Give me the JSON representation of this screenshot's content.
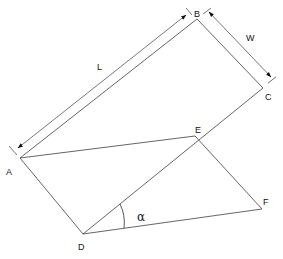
{
  "diagram": {
    "type": "geometry",
    "points": {
      "A": {
        "label": "A",
        "x": 20,
        "y": 158
      },
      "B": {
        "label": "B",
        "x": 197,
        "y": 19
      },
      "C": {
        "label": "C",
        "x": 263,
        "y": 88
      },
      "D": {
        "label": "D",
        "x": 83,
        "y": 234
      },
      "E": {
        "label": "E",
        "x": 199,
        "y": 139
      },
      "F": {
        "label": "F",
        "x": 262,
        "y": 209
      }
    },
    "edges": [
      [
        "A",
        "B"
      ],
      [
        "B",
        "C"
      ],
      [
        "C",
        "D"
      ],
      [
        "A",
        "D"
      ],
      [
        "A",
        "E"
      ],
      [
        "E",
        "F"
      ],
      [
        "D",
        "F"
      ]
    ],
    "dimensions": {
      "length": {
        "label": "L"
      },
      "width": {
        "label": "W"
      }
    },
    "angle": {
      "label": "α",
      "vertex": "D",
      "between": [
        "E",
        "F"
      ]
    }
  }
}
